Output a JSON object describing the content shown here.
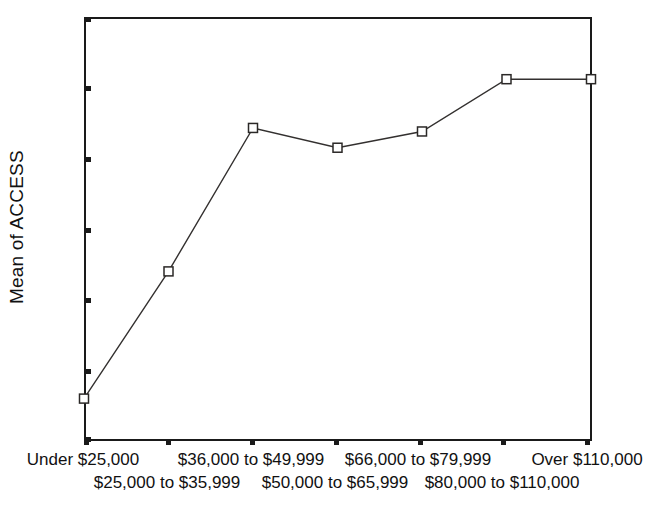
{
  "chart_data": {
    "type": "line",
    "title": "",
    "xlabel": "",
    "ylabel": "Mean of ACCESS",
    "ylim": [
      0.4,
      1.0
    ],
    "grid": false,
    "legend": "none",
    "marker": "open-square",
    "categories": [
      "Under $25,000",
      "$25,000 to $35,999",
      "$36,000 to $49,999",
      "$50,000 to $65,999",
      "$66,000 to $79,999",
      "$80,000 to $110,000",
      "Over $110,000"
    ],
    "values": [
      0.46,
      0.64,
      0.843,
      0.815,
      0.838,
      0.912,
      0.912
    ],
    "y_ticks": [
      "1.0",
      ".9",
      ".8",
      ".7",
      ".6",
      ".5",
      ".4"
    ],
    "y_tick_values": [
      1.0,
      0.9,
      0.8,
      0.7,
      0.6,
      0.5,
      0.4
    ],
    "x_labels_row_top": [
      "Under $25,000",
      "$36,000 to $49,999",
      "$66,000 to $79,999",
      "Over $110,000"
    ],
    "x_labels_row_bottom": [
      "$25,000 to $35,999",
      "$50,000 to $65,999",
      "$80,000 to $110,000"
    ],
    "colors": {
      "line": "#33302f",
      "marker_fill": "#ffffff",
      "marker_stroke": "#2b2827",
      "axis": "#1a1a1a",
      "background": "#ffffff",
      "text": "#111111"
    }
  }
}
